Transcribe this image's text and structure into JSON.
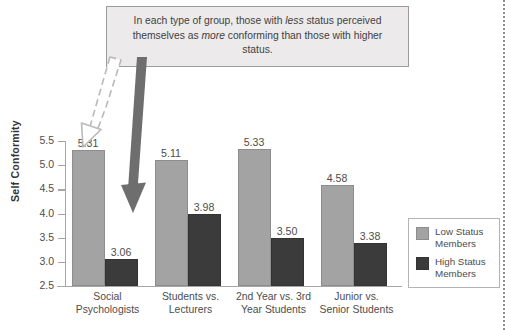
{
  "callout": {
    "text_part1": "In each type of group, those with ",
    "em1": "less",
    "text_part2": " status perceived themselves as ",
    "em2": "more",
    "text_part3": " conforming than those with higher status."
  },
  "legend": {
    "items": [
      {
        "label_line1": "Low Status",
        "label_line2": "Members",
        "color": "#a3a3a3"
      },
      {
        "label_line1": "High Status",
        "label_line2": "Members",
        "color": "#3b3b3b"
      }
    ]
  },
  "chart_data": {
    "type": "bar",
    "title": "",
    "xlabel": "",
    "ylabel": "Self Conformity",
    "ylim": [
      2.5,
      5.5
    ],
    "yticks": [
      "2.5",
      "3.0",
      "3.5",
      "4.0",
      "4.5",
      "5.0",
      "5.5"
    ],
    "ytick_values": [
      2.5,
      3.0,
      3.5,
      4.0,
      4.5,
      5.0,
      5.5
    ],
    "grid": false,
    "legend_position": "right",
    "categories": [
      "Social Psychologists",
      "Students vs. Lecturers",
      "2nd Year vs. 3rd Year Students",
      "Junior vs. Senior Students"
    ],
    "category_lines": [
      [
        "Social",
        "Psychologists"
      ],
      [
        "Students vs.",
        "Lecturers"
      ],
      [
        "2nd Year vs. 3rd",
        "Year Students"
      ],
      [
        "Junior vs.",
        "Senior Students"
      ]
    ],
    "series": [
      {
        "name": "Low Status Members",
        "color": "#a3a3a3",
        "values": [
          5.31,
          5.11,
          5.33,
          4.58
        ],
        "labels": [
          "5.31",
          "5.11",
          "5.33",
          "4.58"
        ]
      },
      {
        "name": "High Status Members",
        "color": "#3b3b3b",
        "values": [
          3.06,
          3.98,
          3.5,
          3.38
        ],
        "labels": [
          "3.06",
          "3.98",
          "3.50",
          "3.38"
        ]
      }
    ]
  },
  "annotations": {
    "arrow_outline": "dashed-outline-arrow-pointing-down",
    "arrow_solid": "solid-arrow-pointing-to-high-status-bar"
  }
}
